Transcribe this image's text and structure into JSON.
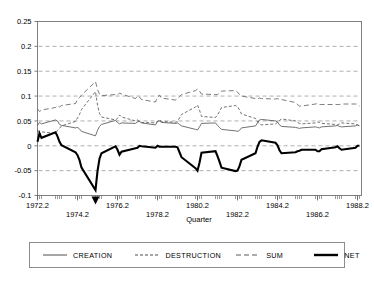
{
  "chart_data": {
    "type": "line",
    "title": "",
    "subtitle": "",
    "xlabel": "Quarter",
    "ylabel": "",
    "ylim": [
      -0.1,
      0.25
    ],
    "xlim": [
      1972.2,
      1988.4
    ],
    "grid": true,
    "grid_orientation": "horizontal",
    "legend_position": "bottom",
    "ytick_labels": [
      "0.25",
      "0.2",
      "0.15",
      "0.1",
      "0.05",
      "0",
      "-0.05",
      "-0.1"
    ],
    "ytick_values": [
      0.25,
      0.2,
      0.15,
      0.1,
      0.05,
      0,
      -0.05,
      -0.1
    ],
    "xtick_labels_upper": [
      "1972.2",
      "1976.2",
      "1980.2",
      "1984.2",
      "1988.2"
    ],
    "xtick_values_upper": [
      1972.2,
      1976.2,
      1980.2,
      1984.2,
      1988.2
    ],
    "xtick_labels_lower": [
      "1974.2",
      "1978.2",
      "1982.2",
      "1986.2"
    ],
    "xtick_values_lower": [
      1974.2,
      1978.2,
      1982.2,
      1986.2
    ],
    "x": [
      1972.2,
      1972.3,
      1972.4,
      1973.1,
      1973.2,
      1973.3,
      1973.4,
      1974.1,
      1974.2,
      1974.3,
      1974.4,
      1975.1,
      1975.2,
      1975.3,
      1975.4,
      1976.1,
      1976.2,
      1976.3,
      1976.4,
      1977.1,
      1977.2,
      1977.3,
      1977.4,
      1978.1,
      1978.2,
      1978.3,
      1978.4,
      1979.1,
      1979.2,
      1979.3,
      1979.4,
      1980.1,
      1980.2,
      1980.3,
      1980.4,
      1981.1,
      1981.2,
      1981.3,
      1981.4,
      1982.1,
      1982.2,
      1982.3,
      1982.4,
      1983.1,
      1983.2,
      1983.3,
      1983.4,
      1984.1,
      1984.2,
      1984.3,
      1984.4,
      1985.1,
      1985.2,
      1985.3,
      1985.4,
      1986.1,
      1986.2,
      1986.3,
      1986.4,
      1987.1,
      1987.2,
      1987.3,
      1987.4,
      1988.1,
      1988.2,
      1988.3
    ],
    "series": [
      {
        "name": "CREATION",
        "style": "solid-thin",
        "values": [
          0.041,
          0.047,
          0.044,
          0.052,
          0.05,
          0.043,
          0.041,
          0.036,
          0.037,
          0.034,
          0.029,
          0.02,
          0.031,
          0.039,
          0.043,
          0.051,
          0.047,
          0.044,
          0.046,
          0.045,
          0.048,
          0.049,
          0.046,
          0.042,
          0.049,
          0.05,
          0.047,
          0.045,
          0.046,
          0.043,
          0.04,
          0.033,
          0.032,
          0.038,
          0.045,
          0.046,
          0.041,
          0.037,
          0.033,
          0.03,
          0.029,
          0.031,
          0.036,
          0.04,
          0.046,
          0.052,
          0.053,
          0.05,
          0.048,
          0.042,
          0.039,
          0.037,
          0.036,
          0.035,
          0.036,
          0.038,
          0.037,
          0.036,
          0.038,
          0.04,
          0.041,
          0.039,
          0.038,
          0.04,
          0.042,
          0.04
        ]
      },
      {
        "name": "DESTRUCTION",
        "style": "dotted-dash",
        "values": [
          0.033,
          0.022,
          0.028,
          0.025,
          0.031,
          0.035,
          0.04,
          0.049,
          0.056,
          0.063,
          0.073,
          0.109,
          0.082,
          0.065,
          0.058,
          0.052,
          0.055,
          0.062,
          0.058,
          0.05,
          0.052,
          0.049,
          0.047,
          0.046,
          0.049,
          0.052,
          0.049,
          0.047,
          0.049,
          0.056,
          0.063,
          0.078,
          0.082,
          0.072,
          0.059,
          0.057,
          0.062,
          0.069,
          0.077,
          0.081,
          0.079,
          0.072,
          0.064,
          0.055,
          0.048,
          0.044,
          0.042,
          0.044,
          0.047,
          0.051,
          0.054,
          0.05,
          0.047,
          0.045,
          0.044,
          0.046,
          0.048,
          0.047,
          0.045,
          0.043,
          0.042,
          0.044,
          0.046,
          0.044,
          0.042,
          0.04
        ]
      },
      {
        "name": "SUM",
        "style": "dashed",
        "values": [
          0.074,
          0.069,
          0.072,
          0.077,
          0.081,
          0.078,
          0.081,
          0.085,
          0.093,
          0.097,
          0.102,
          0.129,
          0.113,
          0.104,
          0.101,
          0.103,
          0.102,
          0.106,
          0.104,
          0.095,
          0.1,
          0.098,
          0.093,
          0.088,
          0.098,
          0.102,
          0.096,
          0.092,
          0.095,
          0.099,
          0.103,
          0.111,
          0.114,
          0.11,
          0.104,
          0.103,
          0.103,
          0.106,
          0.11,
          0.111,
          0.108,
          0.103,
          0.1,
          0.095,
          0.094,
          0.096,
          0.095,
          0.094,
          0.095,
          0.093,
          0.093,
          0.087,
          0.083,
          0.08,
          0.08,
          0.084,
          0.085,
          0.083,
          0.083,
          0.083,
          0.083,
          0.083,
          0.084,
          0.084,
          0.084,
          0.08
        ]
      },
      {
        "name": "NET",
        "style": "solid-thick",
        "values": [
          0.008,
          0.025,
          0.016,
          0.027,
          0.019,
          0.008,
          0.001,
          -0.013,
          -0.019,
          -0.029,
          -0.044,
          -0.089,
          -0.051,
          -0.026,
          -0.015,
          -0.001,
          -0.008,
          -0.018,
          -0.012,
          -0.005,
          -0.004,
          0.0,
          -0.001,
          -0.004,
          0.0,
          -0.002,
          -0.002,
          -0.002,
          -0.003,
          -0.013,
          -0.023,
          -0.045,
          -0.05,
          -0.034,
          -0.014,
          -0.011,
          -0.021,
          -0.032,
          -0.044,
          -0.051,
          -0.05,
          -0.041,
          -0.028,
          -0.015,
          -0.002,
          0.008,
          0.011,
          0.006,
          0.001,
          -0.009,
          -0.015,
          -0.013,
          -0.011,
          -0.01,
          -0.008,
          -0.008,
          -0.011,
          -0.011,
          -0.007,
          -0.003,
          -0.001,
          -0.005,
          -0.008,
          -0.004,
          0.0,
          0.0
        ]
      }
    ],
    "annotations": [
      {
        "name": "peak-marker",
        "type": "triangle",
        "x": 1975.1,
        "note": ""
      }
    ]
  },
  "legend": {
    "entries": [
      {
        "label": "CREATION",
        "style": "solid-thin"
      },
      {
        "label": "DESTRUCTION",
        "style": "dotted-dash"
      },
      {
        "label": "SUM",
        "style": "dashed"
      },
      {
        "label": "NET",
        "style": "solid-thick"
      }
    ]
  },
  "colors": {
    "background": "#ffffff",
    "frame": "#808080",
    "gridline": "#9a9a9a",
    "net_line": "#000000",
    "other_lines": "#4d4d4d"
  }
}
